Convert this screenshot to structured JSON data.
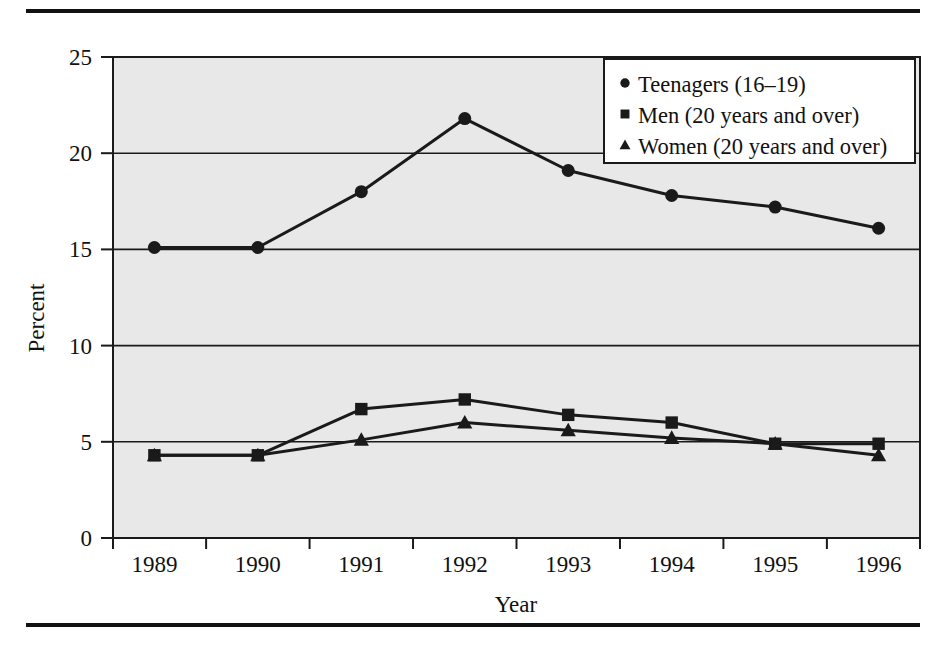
{
  "figure": {
    "top_rule": "horizontal-rule",
    "bottom_rule": "horizontal-rule"
  },
  "chart_data": {
    "type": "line",
    "title": "",
    "subtitle": "",
    "xlabel": "Year",
    "ylabel": "Percent",
    "categories": [
      "1989",
      "1990",
      "1991",
      "1992",
      "1993",
      "1994",
      "1995",
      "1996"
    ],
    "x": [
      1989,
      1990,
      1991,
      1992,
      1993,
      1994,
      1995,
      1996
    ],
    "xlim": [
      1988.6,
      1996.4
    ],
    "ylim": [
      0,
      25
    ],
    "yticks": [
      0,
      5,
      10,
      15,
      20,
      25
    ],
    "ytick_labels": [
      "0",
      "5",
      "10",
      "15",
      "20",
      "25"
    ],
    "xtick_labels": [
      "1989",
      "1990",
      "1991",
      "1992",
      "1993",
      "1994",
      "1995",
      "1996"
    ],
    "grid": "horizontal",
    "legend_position": "top-right",
    "plot_background": "#e8e8e8",
    "line_color": "#1a1a1a",
    "series": [
      {
        "name": "Teenagers (16–19)",
        "marker": "circle",
        "values": [
          15.1,
          15.1,
          18.0,
          21.8,
          19.1,
          17.8,
          17.2,
          16.1
        ]
      },
      {
        "name": "Men (20 years and over)",
        "marker": "square",
        "values": [
          4.3,
          4.3,
          6.7,
          7.2,
          6.4,
          6.0,
          4.9,
          4.9
        ]
      },
      {
        "name": "Women (20 years and over)",
        "marker": "triangle",
        "values": [
          4.3,
          4.3,
          5.1,
          6.0,
          5.6,
          5.2,
          4.9,
          4.3
        ]
      }
    ]
  },
  "legend": {
    "items": [
      {
        "marker": "circle",
        "label": "Teenagers (16–19)"
      },
      {
        "marker": "square",
        "label": "Men (20 years and over)"
      },
      {
        "marker": "triangle",
        "label": "Women (20 years and over)"
      }
    ]
  }
}
